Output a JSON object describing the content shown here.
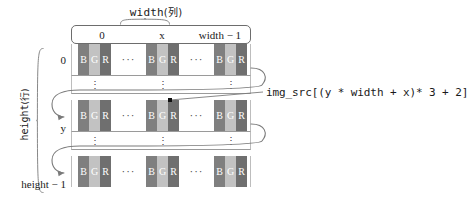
{
  "diagram": {
    "title_top": "width",
    "title_top_cjk": "(列)",
    "title_left": "height",
    "title_left_cjk": "(行)",
    "column_labels": [
      "0",
      "x",
      "width − 1"
    ],
    "row_labels": [
      "0",
      "y",
      "height − 1"
    ],
    "channels": [
      "B",
      "G",
      "R"
    ],
    "ellipsis_horizontal": "···",
    "ellipsis_vertical": "⋮",
    "formula": "img_src[(y * width + x)* 3 + 2]",
    "colors": {
      "channel_b": "#7f7f7f",
      "channel_g": "#c2c2c2",
      "channel_r": "#6f6f6f",
      "grid_line": "#9a9a9a",
      "arrow": "#7a7a7a",
      "marker": "#111111",
      "text": "#1a1a1a"
    }
  }
}
